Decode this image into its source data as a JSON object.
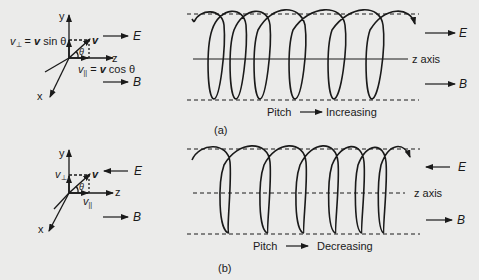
{
  "panel_a": {
    "caption": "(a)",
    "axes": {
      "y": "y",
      "x": "x",
      "z": "z"
    },
    "velocity_label": "v",
    "angle_label": "θ",
    "v_perp_prefix": "v",
    "v_perp_sub": "⊥",
    "v_perp_eq": " = ",
    "v_perp_bold": "v",
    "v_perp_tail": " sin θ",
    "v_par_prefix": "v",
    "v_par_sub": "||",
    "v_par_eq": " = ",
    "v_par_bold": "v",
    "v_par_tail": " cos θ",
    "field_E": "E",
    "field_B": "B",
    "helix_axis_label": "z axis",
    "pitch_label": "Pitch",
    "pitch_trend": "Increasing",
    "E_direction": "right",
    "B_direction": "right"
  },
  "panel_b": {
    "caption": "(b)",
    "axes": {
      "y": "y",
      "x": "x",
      "z": "z"
    },
    "velocity_label": "v",
    "angle_label": "θ",
    "v_perp_prefix": "v",
    "v_perp_sub": "⊥",
    "v_par_prefix": "v",
    "v_par_sub": "||",
    "field_E": "E",
    "field_B": "B",
    "helix_axis_label": "z axis",
    "pitch_label": "Pitch",
    "pitch_trend": "Decreasing",
    "E_direction": "left",
    "B_direction": "right"
  },
  "colors": {
    "background": "#ebebea",
    "ink": "#1a1a1a"
  }
}
